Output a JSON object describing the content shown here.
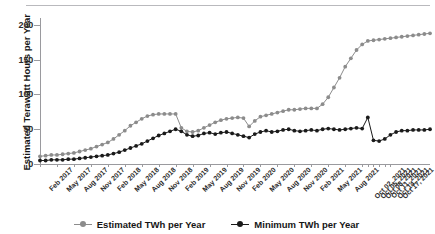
{
  "chart_data": {
    "type": "line",
    "title": "",
    "xlabel": "",
    "ylabel": "Estimated Terawatt Hours per Year",
    "ylim": [
      0,
      210
    ],
    "yticks": [
      0,
      50,
      100,
      150,
      200
    ],
    "grid": false,
    "legend_position": "bottom",
    "x_tick_labels": [
      "Feb 2017",
      "May 2017",
      "Aug 2017",
      "Nov 2017",
      "Feb 2018",
      "May 2018",
      "Aug 2018",
      "Nov 2018",
      "Feb 2019",
      "May 2019",
      "Aug 2019",
      "Nov 2019",
      "Feb 2020",
      "May 2020",
      "Aug 2020",
      "Nov 2020",
      "Feb 2021",
      "May 2021",
      "Aug 2021",
      "Oct 02, 2021",
      "Oct 05, 2021",
      "Oct 08, 2021",
      "Oct 11, 2021",
      "Oct 14, 2021",
      "Oct 17, 2021"
    ],
    "x_tick_indices": [
      0,
      3,
      6,
      9,
      12,
      15,
      18,
      21,
      24,
      27,
      30,
      33,
      36,
      39,
      42,
      45,
      48,
      51,
      54,
      57,
      58,
      59,
      60,
      61,
      62
    ],
    "series": [
      {
        "name": "Estimated TWh per Year",
        "color": "#8c8c8c",
        "marker": "circle",
        "values": [
          11,
          12,
          13,
          13,
          14,
          15,
          16,
          18,
          20,
          22,
          25,
          28,
          31,
          36,
          42,
          48,
          55,
          60,
          65,
          69,
          71,
          72,
          72,
          72,
          72,
          52,
          47,
          46,
          48,
          52,
          56,
          60,
          63,
          65,
          66,
          67,
          66,
          54,
          62,
          68,
          70,
          72,
          74,
          76,
          78,
          78,
          79,
          80,
          80,
          80,
          86,
          96,
          110,
          124,
          140,
          152,
          164,
          172,
          177,
          178,
          179,
          180,
          181,
          182,
          183,
          184,
          185,
          186,
          187,
          188
        ]
      },
      {
        "name": "Minimum TWh per Year",
        "color": "#1a1a1a",
        "marker": "circle",
        "values": [
          5,
          5,
          6,
          6,
          6,
          7,
          7,
          8,
          9,
          10,
          11,
          12,
          13,
          15,
          17,
          20,
          23,
          26,
          29,
          33,
          37,
          41,
          44,
          47,
          50,
          47,
          42,
          40,
          41,
          44,
          45,
          43,
          45,
          46,
          44,
          42,
          40,
          38,
          43,
          46,
          48,
          46,
          47,
          49,
          50,
          48,
          47,
          48,
          49,
          48,
          50,
          51,
          50,
          49,
          50,
          51,
          52,
          51,
          67,
          34,
          33,
          36,
          42,
          46,
          48,
          48,
          49,
          49,
          49,
          50
        ]
      }
    ]
  }
}
